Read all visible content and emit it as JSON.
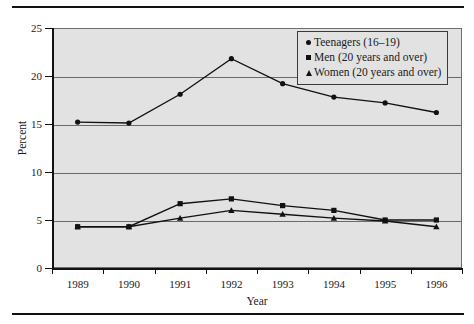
{
  "chart_data": {
    "type": "line",
    "title": "",
    "xlabel": "Year",
    "ylabel": "Percent",
    "categories": [
      "1989",
      "1990",
      "1991",
      "1992",
      "1993",
      "1994",
      "1995",
      "1996"
    ],
    "ylim": [
      0,
      25
    ],
    "yticks": [
      0,
      5,
      10,
      15,
      20,
      25
    ],
    "ytick_labels": [
      "0",
      "5",
      "10",
      "15",
      "20",
      "25"
    ],
    "grid": "horizontal",
    "legend_position": "top-right",
    "series": [
      {
        "name": "Teenagers (16–19)",
        "marker": "circle",
        "values": [
          15.2,
          15.1,
          18.1,
          21.8,
          19.2,
          17.8,
          17.2,
          16.2
        ]
      },
      {
        "name": "Men (20 years and over)",
        "marker": "square",
        "values": [
          4.3,
          4.3,
          6.7,
          7.2,
          6.5,
          6.0,
          5.0,
          5.0
        ]
      },
      {
        "name": "Women (20 years and over)",
        "marker": "triangle",
        "values": [
          4.3,
          4.3,
          5.2,
          6.0,
          5.6,
          5.2,
          4.9,
          4.3
        ]
      }
    ]
  },
  "axes": {
    "y_title": "Percent",
    "x_title": "Year",
    "y_tick_labels": [
      "25",
      "20",
      "15",
      "10",
      "5",
      "0"
    ],
    "x_tick_labels": [
      "1989",
      "1990",
      "1991",
      "1992",
      "1993",
      "1994",
      "1995",
      "1996"
    ]
  },
  "legend": {
    "entries": [
      {
        "label": "Teenagers (16–19)",
        "marker": "circle-marker"
      },
      {
        "label": "Men (20 years and over)",
        "marker": "square-marker"
      },
      {
        "label": "Women (20 years and over)",
        "marker": "triangle-marker"
      }
    ]
  },
  "colors": {
    "plot_background": "#e2e2e2",
    "line": "#111111",
    "gridline": "#6b6b6b",
    "axis": "#111111",
    "page_background": "#ffffff"
  }
}
